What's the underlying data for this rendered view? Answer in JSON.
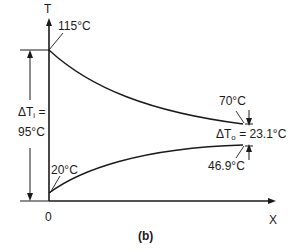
{
  "diagram": {
    "caption": "(b)",
    "axes": {
      "y_label": "T",
      "x_label": "X",
      "origin_label": "0"
    },
    "hot_stream": {
      "inlet_temp": "115°C",
      "outlet_temp": "70°C"
    },
    "cold_stream": {
      "inlet_temp": "20°C",
      "outlet_temp": "46.9°C"
    },
    "inlet_difference": {
      "symbol": "ΔT",
      "subscript": "i",
      "equals": " =",
      "value": "95°C"
    },
    "outlet_difference": {
      "symbol": "ΔT",
      "subscript": "o",
      "rest": " = 23.1°C"
    },
    "colors": {
      "line": "#1a1a1a",
      "background": "#ffffff"
    }
  }
}
